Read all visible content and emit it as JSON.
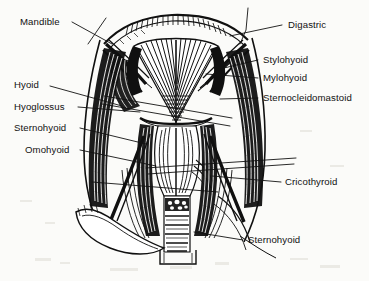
{
  "figure": {
    "caption": "",
    "style": "black-and-white line engraving / anatomical dissection drawing",
    "background_color": "#fbfbf9",
    "ink_color": "#101010",
    "view": "anterior view of the neck, superficial and infrahyoid muscles"
  },
  "labels": {
    "mandible": "Mandible",
    "hyoid": "Hyoid",
    "hyoglossus": "Hyoglossus",
    "sternohyoid_upper": "Sternohyoid",
    "omohyoid": "Omohyoid",
    "digastric": "Digastric",
    "stylohyoid": "Stylohyoid",
    "mylohyoid": "Mylohyoid",
    "sternocleidomastoid": "Sternocleidomastoid",
    "cricothyroid": "Cricothyroid",
    "sternohyoid_lower": "Sternohyoid"
  },
  "annotations": [
    {
      "id": "mandible",
      "text": "Mandible",
      "side": "left",
      "text_x": 20,
      "text_y": 25,
      "line_from_x": 72,
      "line_from_y": 22,
      "line_to_x": 108,
      "line_to_y": 40
    },
    {
      "id": "hyoid",
      "text": "Hyoid",
      "side": "left",
      "text_x": 14,
      "text_y": 88,
      "line_from_x": 50,
      "line_from_y": 85,
      "line_to_x": 118,
      "line_to_y": 104
    },
    {
      "id": "hyoglossus",
      "text": "Hyoglossus",
      "side": "left",
      "text_x": 14,
      "text_y": 110,
      "line_from_x": 78,
      "line_from_y": 107,
      "line_to_x": 135,
      "line_to_y": 110
    },
    {
      "id": "sternohyoid-upper",
      "text": "Sternohyoid",
      "side": "left",
      "text_x": 14,
      "text_y": 131,
      "line_from_x": 80,
      "line_from_y": 128,
      "line_to_x": 140,
      "line_to_y": 143
    },
    {
      "id": "omohyoid",
      "text": "Omohyoid",
      "side": "left",
      "text_x": 25,
      "text_y": 153,
      "line_from_x": 80,
      "line_from_y": 150,
      "line_to_x": 150,
      "line_to_y": 164
    },
    {
      "id": "digastric",
      "text": "Digastric",
      "side": "right",
      "text_x": 288,
      "text_y": 28,
      "line_from_x": 282,
      "line_from_y": 25,
      "line_to_x": 222,
      "line_to_y": 41
    },
    {
      "id": "stylohyoid",
      "text": "Stylohyoid",
      "side": "right",
      "text_x": 263,
      "text_y": 63,
      "line_from_x": 258,
      "line_from_y": 60,
      "line_to_x": 222,
      "line_to_y": 67
    },
    {
      "id": "mylohyoid",
      "text": "Mylohyoid",
      "side": "right",
      "text_x": 263,
      "text_y": 81,
      "line_from_x": 258,
      "line_from_y": 78,
      "line_to_x": 208,
      "line_to_y": 74
    },
    {
      "id": "sternocleidomastoid",
      "text": "Sternocleidomastoid",
      "side": "right",
      "text_x": 263,
      "text_y": 101,
      "line_from_x": 258,
      "line_from_y": 98,
      "line_to_x": 219,
      "line_to_y": 98
    },
    {
      "id": "cricothyroid",
      "text": "Cricothyroid",
      "side": "right",
      "text_x": 285,
      "text_y": 185,
      "line_from_x": 281,
      "line_from_y": 182,
      "line_to_x": 215,
      "line_to_y": 177
    },
    {
      "id": "sternohyoid-lower",
      "text": "Sternohyoid",
      "side": "right",
      "text_x": 248,
      "text_y": 243,
      "line_from_x": 243,
      "line_from_y": 240,
      "line_to_x": 196,
      "line_to_y": 233
    }
  ]
}
